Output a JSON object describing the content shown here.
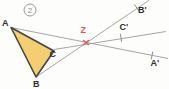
{
  "figure": {
    "badge": {
      "number": "2"
    },
    "labels": {
      "a": "A",
      "b": "B",
      "c": "C",
      "z": "Z",
      "a_prime": "A'",
      "b_prime": "B'",
      "c_prime": "C'"
    },
    "colors": {
      "triangle_fill": "#f5cd72",
      "triangle_stroke": "#454545",
      "construction_line": "#9b9b9b",
      "tick": "#8c8c8c",
      "accent_red": "#e2574c",
      "label": "#2d2d2d",
      "badge": "#8a8a8a",
      "background": "#fdfdfc"
    }
  }
}
